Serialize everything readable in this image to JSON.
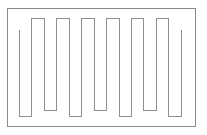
{
  "figure": {
    "type": "line-drawing",
    "canvas": {
      "width": 207,
      "height": 135
    },
    "background_color": "#ffffff"
  },
  "frame": {
    "label": "Outer Rectangle Border",
    "x": 7,
    "y": 8.5,
    "width": 188,
    "height": 117.5,
    "stroke_color": "#8a8a8a",
    "stroke_width": 1,
    "fill": "none"
  },
  "serpentine": {
    "label": "Boustrophedon Serpentine Path",
    "stroke_color": "#8f8f8f",
    "stroke_width": 1,
    "fill": "none",
    "top_turn_y": 18.5,
    "bottom_turn_y": 116,
    "stub_top_y": 30,
    "stub_bottom_y": 110,
    "vertical_xs": [
      19.5,
      31.5,
      44,
      56.5,
      69,
      81.5,
      94,
      106.5,
      119,
      131,
      143.5,
      156,
      168.5,
      181
    ],
    "path_d": "M 19.5 30 L 19.5 116 L 31.5 116 L 31.5 18.5 L 44 18.5 L 44 110 L 56.5 110 L 56.5 18.5 L 69 18.5 L 69 116 L 81.5 116 L 81.5 18.5 L 94 18.5 L 94 110 L 106.5 110 L 106.5 18.5 L 119 18.5 L 119 116 L 131 116 L 131 18.5 L 143.5 18.5 L 143.5 110 L 156 110 L 156 18.5 L 168.5 18.5 L 168.5 116 L 181 116 L 181 30",
    "segment_count": 14,
    "turn_count": 13
  },
  "colors": {
    "stroke": "#8a8a8a",
    "background": "#ffffff"
  }
}
